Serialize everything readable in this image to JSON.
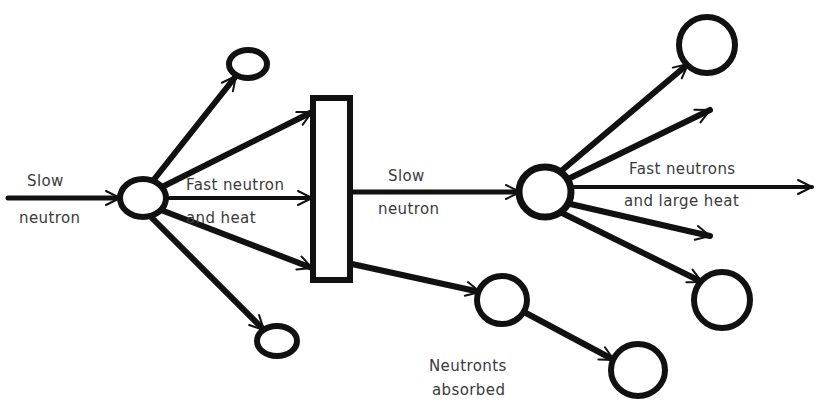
{
  "diagram": {
    "canvas": {
      "width": 823,
      "height": 414,
      "background": "#ffffff"
    },
    "ink_color": "#111111",
    "label_color": "#3a3a3a",
    "labels": {
      "slow_neutron_in_line1": "Slow",
      "slow_neutron_in_line2": "neutron",
      "fast_neutron_heat_line1": "Fast neutron",
      "fast_neutron_heat_line2": "and heat",
      "slow_neutron_mid_line1": "Slow",
      "slow_neutron_mid_line2": "neutron",
      "fast_neutrons_large_heat_line1": "Fast neutrons",
      "fast_neutrons_large_heat_line2": "and large heat",
      "neutrons_absorbed_line1": "Neutronts",
      "neutrons_absorbed_line2": "absorbed"
    },
    "nuclei": [
      {
        "name": "first-fissile-nucleus",
        "cx": 143,
        "cy": 198,
        "rx": 23,
        "ry": 19,
        "stroke_width": 6
      },
      {
        "name": "emitted-neutron-upper-left",
        "cx": 248,
        "cy": 64,
        "rx": 19,
        "ry": 14,
        "stroke_width": 6
      },
      {
        "name": "emitted-neutron-lower-left",
        "cx": 277,
        "cy": 341,
        "rx": 20,
        "ry": 15,
        "stroke_width": 6
      },
      {
        "name": "second-fissile-nucleus",
        "cx": 545,
        "cy": 192,
        "rx": 26,
        "ry": 25,
        "stroke_width": 7
      },
      {
        "name": "emitted-neutron-upper-right",
        "cx": 707,
        "cy": 45,
        "rx": 28,
        "ry": 28,
        "stroke_width": 6
      },
      {
        "name": "emitted-neutron-lower-right",
        "cx": 722,
        "cy": 300,
        "rx": 28,
        "ry": 28,
        "stroke_width": 6
      },
      {
        "name": "absorbed-neutron-first",
        "cx": 502,
        "cy": 300,
        "rx": 25,
        "ry": 24,
        "stroke_width": 6
      },
      {
        "name": "absorbed-neutron-second",
        "cx": 638,
        "cy": 370,
        "rx": 27,
        "ry": 26,
        "stroke_width": 6
      }
    ],
    "barrier": {
      "name": "moderator-barrier",
      "x": 313,
      "y": 98,
      "width": 37,
      "height": 182,
      "stroke_width": 6
    },
    "rays": [
      {
        "name": "incoming-slow-neutron-ray",
        "x1": 8,
        "y1": 198,
        "x2": 120,
        "y2": 198,
        "width": 5
      },
      {
        "name": "ray-to-upper-left-neutron",
        "x1": 152,
        "y1": 182,
        "x2": 236,
        "y2": 76,
        "width": 6
      },
      {
        "name": "ray-to-barrier-top",
        "x1": 160,
        "y1": 188,
        "x2": 312,
        "y2": 112,
        "width": 6
      },
      {
        "name": "ray-to-barrier-middle",
        "x1": 166,
        "y1": 198,
        "x2": 312,
        "y2": 198,
        "width": 4
      },
      {
        "name": "ray-to-barrier-bottom",
        "x1": 161,
        "y1": 210,
        "x2": 312,
        "y2": 268,
        "width": 6
      },
      {
        "name": "ray-to-lower-left-neutron",
        "x1": 150,
        "y1": 216,
        "x2": 264,
        "y2": 330,
        "width": 6
      },
      {
        "name": "moderated-slow-neutron-ray",
        "x1": 350,
        "y1": 192,
        "x2": 520,
        "y2": 192,
        "width": 5
      },
      {
        "name": "absorbed-neutron-ray-1",
        "x1": 352,
        "y1": 264,
        "x2": 480,
        "y2": 292,
        "width": 6
      },
      {
        "name": "absorbed-neutron-ray-2",
        "x1": 524,
        "y1": 312,
        "x2": 614,
        "y2": 360,
        "width": 6
      },
      {
        "name": "ray-to-upper-right-neutron",
        "x1": 560,
        "y1": 172,
        "x2": 688,
        "y2": 64,
        "width": 6
      },
      {
        "name": "ray-fast-neutron-upper",
        "x1": 566,
        "y1": 180,
        "x2": 710,
        "y2": 110,
        "width": 6
      },
      {
        "name": "ray-fast-neutron-horizontal",
        "x1": 570,
        "y1": 187,
        "x2": 812,
        "y2": 187,
        "width": 4
      },
      {
        "name": "ray-fast-neutron-lower",
        "x1": 566,
        "y1": 203,
        "x2": 710,
        "y2": 236,
        "width": 6
      },
      {
        "name": "ray-to-lower-right-neutron",
        "x1": 560,
        "y1": 212,
        "x2": 702,
        "y2": 282,
        "width": 6
      }
    ],
    "arrow_heads": [
      {
        "name": "arrowhead-incoming-slow-neutron",
        "x": 120,
        "y": 198,
        "angle": 0
      },
      {
        "name": "arrowhead-upper-left-neutron",
        "x": 236,
        "y": 76,
        "angle": -52
      },
      {
        "name": "arrowhead-barrier-top",
        "x": 312,
        "y": 112,
        "angle": -27
      },
      {
        "name": "arrowhead-barrier-middle",
        "x": 312,
        "y": 198,
        "angle": 0
      },
      {
        "name": "arrowhead-barrier-bottom",
        "x": 312,
        "y": 268,
        "angle": 21
      },
      {
        "name": "arrowhead-lower-left-neutron",
        "x": 264,
        "y": 330,
        "angle": 45
      },
      {
        "name": "arrowhead-moderated-slow-neutron",
        "x": 520,
        "y": 192,
        "angle": 0
      },
      {
        "name": "arrowhead-absorbed-neutron-1",
        "x": 480,
        "y": 292,
        "angle": 13
      },
      {
        "name": "arrowhead-absorbed-neutron-2",
        "x": 614,
        "y": 360,
        "angle": 28
      },
      {
        "name": "arrowhead-upper-right-neutron",
        "x": 688,
        "y": 64,
        "angle": -40
      },
      {
        "name": "arrowhead-fast-neutron-upper",
        "x": 710,
        "y": 110,
        "angle": -26
      },
      {
        "name": "arrowhead-fast-neutron-horizontal",
        "x": 812,
        "y": 187,
        "angle": 0
      },
      {
        "name": "arrowhead-fast-neutron-lower",
        "x": 710,
        "y": 236,
        "angle": 13
      },
      {
        "name": "arrowhead-lower-right-neutron",
        "x": 702,
        "y": 282,
        "angle": 26
      }
    ],
    "label_positions": {
      "slow_neutron_in": {
        "x1": 27,
        "y1": 186,
        "x2": 19,
        "y2": 223
      },
      "fast_neutron_heat": {
        "x1": 186,
        "y1": 190,
        "x2": 186,
        "y2": 223
      },
      "slow_neutron_mid": {
        "x1": 388,
        "y1": 181,
        "x2": 378,
        "y2": 214
      },
      "fast_neutrons_large_heat": {
        "x1": 629,
        "y1": 174,
        "x2": 624,
        "y2": 206
      },
      "neutrons_absorbed": {
        "x1": 429,
        "y1": 371,
        "x2": 432,
        "y2": 395
      }
    }
  }
}
